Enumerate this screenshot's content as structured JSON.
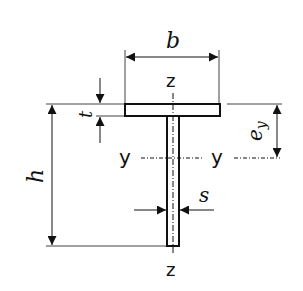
{
  "diagram": {
    "labels": {
      "width": "b",
      "height": "h",
      "flange_thickness": "t",
      "web_thickness": "s",
      "centroid_offset": "e",
      "centroid_offset_subscript": "y",
      "axis_z_top": "z",
      "axis_z_bottom": "z",
      "axis_y_left": "y",
      "axis_y_right": "y"
    },
    "colors": {
      "line": "#111111",
      "background": "#ffffff"
    }
  }
}
